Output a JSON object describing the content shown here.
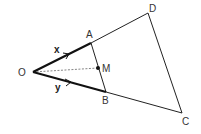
{
  "diagram": {
    "type": "geometry-vector-diagram",
    "points": {
      "O": {
        "label": "O",
        "x": 33,
        "y": 72
      },
      "A": {
        "label": "A",
        "x": 91,
        "y": 43
      },
      "B": {
        "label": "B",
        "x": 106,
        "y": 92
      },
      "M": {
        "label": "M",
        "x": 98,
        "y": 68
      },
      "D": {
        "label": "D",
        "x": 148,
        "y": 13
      },
      "C": {
        "label": "C",
        "x": 182,
        "y": 113
      }
    },
    "vectors": {
      "OA": {
        "label": "x"
      },
      "OB": {
        "label": "y"
      }
    },
    "segments": [
      "OA",
      "OB",
      "AD",
      "BC",
      "AB",
      "DC"
    ],
    "dashed": [
      "OM"
    ],
    "colors": {
      "line": "#222222",
      "dashed": "#666666",
      "label": "#333333"
    }
  }
}
